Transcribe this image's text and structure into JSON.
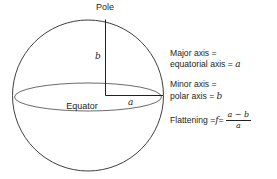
{
  "diagram": {
    "title_labels": {
      "pole": "Pole",
      "equator": "Equator",
      "semi_minor_label": "b",
      "semi_major_label": "a"
    },
    "colors": {
      "stroke": "#3f3f42",
      "equator_stroke": "#6b6b6e",
      "line": "#231f20",
      "text": "#231f20",
      "background": "#ffffff"
    },
    "sphere": {
      "center_x": 88,
      "center_y": 95,
      "radius": 75
    },
    "equator_ellipse": {
      "center_x": 88,
      "center_y": 97,
      "radius_x": 73,
      "radius_y": 14
    }
  },
  "annotations": {
    "major_axis": {
      "line1": "Major axis =",
      "line2_prefix": "equatorial axis = ",
      "line2_var": "a"
    },
    "minor_axis": {
      "line1": "Minor axis =",
      "line2_prefix": "polar axis = ",
      "line2_var": "b"
    },
    "flattening": {
      "label": "Flattening = ",
      "symbol": "f",
      "equals": " = ",
      "numerator": "a − b",
      "denominator": "a"
    }
  }
}
